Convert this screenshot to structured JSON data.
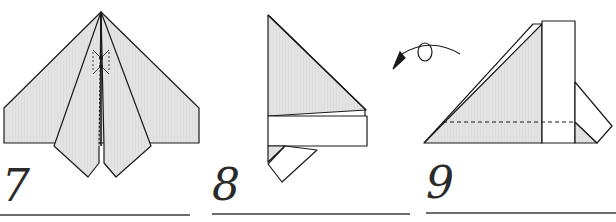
{
  "diagram": {
    "type": "origami-instructions",
    "colors": {
      "paper_shaded": "#e2e2e2",
      "paper_white": "#ffffff",
      "line": "#1a1a1a",
      "rule": "#6d6d6d",
      "number": "#2a2a2a"
    },
    "steps": [
      {
        "number": "7",
        "description": "Completed plane top view with valley/mountain fold marks along center"
      },
      {
        "number": "8",
        "description": "Side view of folded plane with wing band"
      },
      {
        "number": "9",
        "description": "Side view after turning over, dashed fold line"
      }
    ],
    "annotations": {
      "turn_over_arrow": "turn-over arrow with loop"
    }
  }
}
